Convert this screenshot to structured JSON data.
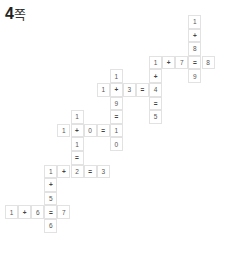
{
  "title": {
    "number": "4",
    "suffix": "쪽"
  },
  "grid": {
    "origin_x": 5,
    "origin_y": 15,
    "col_pitch": 13.1,
    "row_pitch": 13.6
  },
  "cells": [
    {
      "c": 14,
      "r": 0,
      "v": "1"
    },
    {
      "c": 14,
      "r": 1,
      "v": "+"
    },
    {
      "c": 14,
      "r": 2,
      "v": "8"
    },
    {
      "c": 14,
      "r": 3,
      "v": "="
    },
    {
      "c": 14,
      "r": 4,
      "v": "9"
    },
    {
      "c": 11,
      "r": 3,
      "v": "1"
    },
    {
      "c": 12,
      "r": 3,
      "v": "+"
    },
    {
      "c": 13,
      "r": 3,
      "v": "7"
    },
    {
      "c": 15,
      "r": 3,
      "v": "8"
    },
    {
      "c": 11,
      "r": 4,
      "v": "+"
    },
    {
      "c": 11,
      "r": 5,
      "v": "4"
    },
    {
      "c": 11,
      "r": 6,
      "v": "="
    },
    {
      "c": 11,
      "r": 7,
      "v": "5"
    },
    {
      "c": 7,
      "r": 5,
      "v": "1"
    },
    {
      "c": 8,
      "r": 5,
      "v": "+"
    },
    {
      "c": 9,
      "r": 5,
      "v": "3"
    },
    {
      "c": 10,
      "r": 5,
      "v": "="
    },
    {
      "c": 8,
      "r": 4,
      "v": "1"
    },
    {
      "c": 8,
      "r": 6,
      "v": "9"
    },
    {
      "c": 8,
      "r": 7,
      "v": "="
    },
    {
      "c": 8,
      "r": 8,
      "v": "1"
    },
    {
      "c": 8,
      "r": 9,
      "v": "0"
    },
    {
      "c": 4,
      "r": 8,
      "v": "1"
    },
    {
      "c": 5,
      "r": 8,
      "v": "+"
    },
    {
      "c": 6,
      "r": 8,
      "v": "0"
    },
    {
      "c": 7,
      "r": 8,
      "v": "="
    },
    {
      "c": 5,
      "r": 7,
      "v": "1"
    },
    {
      "c": 5,
      "r": 9,
      "v": "1"
    },
    {
      "c": 5,
      "r": 10,
      "v": "="
    },
    {
      "c": 5,
      "r": 11,
      "v": "2"
    },
    {
      "c": 3,
      "r": 11,
      "v": "1"
    },
    {
      "c": 4,
      "r": 11,
      "v": "+"
    },
    {
      "c": 6,
      "r": 11,
      "v": "="
    },
    {
      "c": 7,
      "r": 11,
      "v": "3"
    },
    {
      "c": 3,
      "r": 12,
      "v": "+"
    },
    {
      "c": 3,
      "r": 13,
      "v": "5"
    },
    {
      "c": 3,
      "r": 14,
      "v": "="
    },
    {
      "c": 3,
      "r": 15,
      "v": "6"
    },
    {
      "c": 0,
      "r": 14,
      "v": "1"
    },
    {
      "c": 1,
      "r": 14,
      "v": "+"
    },
    {
      "c": 2,
      "r": 14,
      "v": "6"
    },
    {
      "c": 4,
      "r": 14,
      "v": "7"
    }
  ]
}
